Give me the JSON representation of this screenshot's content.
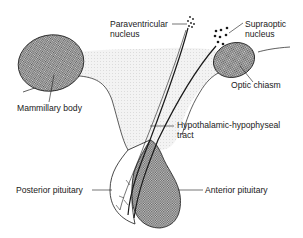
{
  "diagram": {
    "labels": {
      "paraventricular": [
        "Paraventricular",
        "nucleus"
      ],
      "supraoptic": [
        "Supraoptic",
        "nucleus"
      ],
      "mammillary": "Mammillary body",
      "optic_chiasm": "Optic chiasm",
      "tract": [
        "Hypothalamic-hypophyseal",
        "tract"
      ],
      "posterior": "Posterior pituitary",
      "anterior": "Anterior pituitary"
    },
    "colors": {
      "line": "#1a1a1a",
      "hypothalamus_fill": "#ececec",
      "hatch_fill": "#9a9a9a",
      "background": "#ffffff"
    }
  }
}
